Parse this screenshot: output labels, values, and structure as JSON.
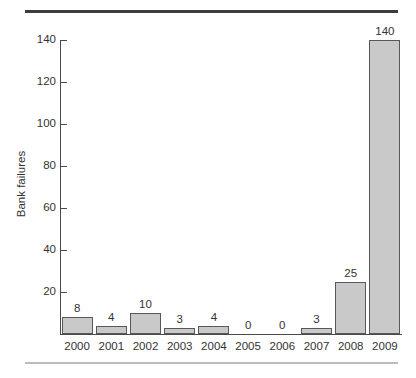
{
  "figure": {
    "background_color": "#ffffff",
    "rule_top_color": "#3d3d3d",
    "rule_bottom_color": "#bcbcbc"
  },
  "chart_data": {
    "type": "bar",
    "title": "",
    "subtitle": "",
    "xlabel": "",
    "ylabel": "Bank failures",
    "categories": [
      "2000",
      "2001",
      "2002",
      "2003",
      "2004",
      "2005",
      "2006",
      "2007",
      "2008",
      "2009"
    ],
    "values": [
      8,
      4,
      10,
      3,
      4,
      0,
      0,
      3,
      25,
      140
    ],
    "data_labels": [
      "8",
      "4",
      "10",
      "3",
      "4",
      "0",
      "0",
      "3",
      "25",
      "140"
    ],
    "ylim": [
      0,
      140
    ],
    "yticks": [
      0,
      20,
      40,
      60,
      80,
      100,
      120,
      140
    ],
    "ytick_labels": [
      "",
      "20",
      "40",
      "60",
      "80",
      "100",
      "120",
      "140"
    ],
    "grid": false,
    "legend": null,
    "legend_position": "none",
    "bar_fill_color": "#c9c9c9",
    "bar_edge_color": "#585858",
    "axis_color": "#4a4a4a",
    "text_color": "#333333"
  }
}
